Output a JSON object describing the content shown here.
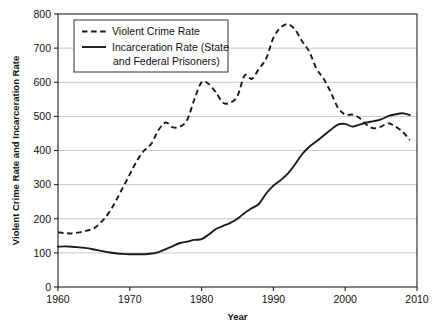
{
  "chart_data": {
    "type": "line",
    "title": "",
    "xlabel": "Year",
    "ylabel": "Violent Crime Rate and Incarceration Rate",
    "xlim": [
      1960,
      2010
    ],
    "ylim": [
      0,
      800
    ],
    "xticks": [
      1960,
      1970,
      1980,
      1990,
      2000,
      2010
    ],
    "yticks": [
      0,
      100,
      200,
      300,
      400,
      500,
      600,
      700,
      800
    ],
    "grid": "horizontal",
    "legend_position": "top-left-inside",
    "series": [
      {
        "name": "Violent Crime Rate",
        "style": "dashed",
        "color": "#1a1a1a",
        "x": [
          1960,
          1961,
          1962,
          1963,
          1964,
          1965,
          1966,
          1967,
          1968,
          1969,
          1970,
          1971,
          1972,
          1973,
          1974,
          1975,
          1976,
          1977,
          1978,
          1979,
          1980,
          1981,
          1982,
          1983,
          1984,
          1985,
          1986,
          1987,
          1988,
          1989,
          1990,
          1991,
          1992,
          1993,
          1994,
          1995,
          1996,
          1997,
          1998,
          1999,
          2000,
          2001,
          2002,
          2003,
          2004,
          2005,
          2006,
          2007,
          2008,
          2009
        ],
        "values": [
          160,
          158,
          157,
          160,
          165,
          172,
          190,
          215,
          250,
          290,
          330,
          370,
          400,
          420,
          460,
          482,
          468,
          470,
          490,
          550,
          600,
          595,
          570,
          540,
          540,
          560,
          620,
          610,
          640,
          670,
          730,
          760,
          770,
          755,
          720,
          690,
          640,
          610,
          570,
          525,
          505,
          505,
          495,
          475,
          465,
          470,
          480,
          470,
          455,
          430
        ]
      },
      {
        "name": "Incarceration Rate (State and Federal Prisoners)",
        "style": "solid",
        "color": "#1a1a1a",
        "x": [
          1960,
          1961,
          1962,
          1963,
          1964,
          1965,
          1966,
          1967,
          1968,
          1969,
          1970,
          1971,
          1972,
          1973,
          1974,
          1975,
          1976,
          1977,
          1978,
          1979,
          1980,
          1981,
          1982,
          1983,
          1984,
          1985,
          1986,
          1987,
          1988,
          1989,
          1990,
          1991,
          1992,
          1993,
          1994,
          1995,
          1996,
          1997,
          1998,
          1999,
          2000,
          2001,
          2002,
          2003,
          2004,
          2005,
          2006,
          2007,
          2008,
          2009
        ],
        "values": [
          118,
          119,
          118,
          116,
          114,
          110,
          106,
          102,
          99,
          97,
          96,
          96,
          96,
          98,
          102,
          111,
          120,
          129,
          133,
          138,
          140,
          154,
          170,
          179,
          188,
          200,
          217,
          231,
          244,
          274,
          297,
          313,
          332,
          359,
          389,
          411,
          427,
          444,
          461,
          476,
          478,
          470,
          476,
          482,
          486,
          491,
          501,
          506,
          509,
          504
        ]
      }
    ]
  },
  "axis": {
    "y_label": "Violent Crime Rate and Incarceration Rate",
    "x_label": "Year",
    "y_tick_labels": [
      "0",
      "100",
      "200",
      "300",
      "400",
      "500",
      "600",
      "700",
      "800"
    ],
    "x_tick_labels": [
      "1960",
      "1970",
      "1980",
      "1990",
      "2000",
      "2010"
    ]
  },
  "legend": {
    "entries": [
      {
        "label": "Violent Crime Rate",
        "style": "dashed"
      },
      {
        "label": "Incarceration Rate (State",
        "style": "solid"
      },
      {
        "label": "and Federal Prisoners)",
        "style": "none"
      }
    ]
  },
  "colors": {
    "line": "#1a1a1a",
    "grid": "#b9b9b9",
    "frame": "#222222",
    "background": "#ffffff"
  }
}
